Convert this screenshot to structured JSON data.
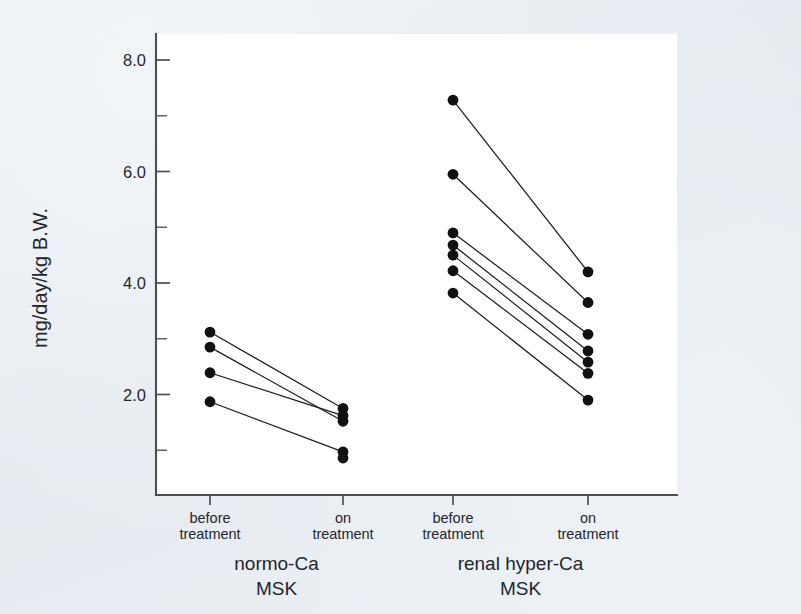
{
  "chart_data": {
    "type": "scatter",
    "subtype": "paired-before-after-dot-plot",
    "title": "",
    "xlabel": "",
    "ylabel": "mg/day/kg B.W.",
    "ylim": [
      0.0,
      8.6
    ],
    "yticks": [
      2.0,
      4.0,
      6.0,
      8.0
    ],
    "ytick_labels": [
      "2.0",
      "4.0",
      "6.0",
      "8.0"
    ],
    "yticks_minor": [
      1.0,
      3.0,
      5.0,
      7.0
    ],
    "grid": false,
    "legend": "none",
    "x_categories": [
      "before treatment",
      "on treatment",
      "before treatment",
      "on treatment"
    ],
    "x_tick_labels": [
      {
        "line1": "before",
        "line2": "treatment"
      },
      {
        "line1": "on",
        "line2": "treatment"
      },
      {
        "line1": "before",
        "line2": "treatment"
      },
      {
        "line1": "on",
        "line2": "treatment"
      }
    ],
    "groups": [
      {
        "name": "normo-Ca MSK",
        "label_line1": "normo-Ca",
        "label_line2": "MSK",
        "n_subjects": 4,
        "series": [
          {
            "name": "before treatment",
            "values": [
              3.12,
              2.85,
              2.39,
              1.87
            ]
          },
          {
            "name": "on treatment",
            "values": [
              1.75,
              1.52,
              1.62,
              0.97
            ]
          }
        ],
        "pairs": [
          {
            "before": 3.12,
            "on": 1.75
          },
          {
            "before": 2.85,
            "on": 1.52
          },
          {
            "before": 2.39,
            "on": 1.62
          },
          {
            "before": 1.87,
            "on": 0.97
          }
        ],
        "on_treatment_extra_points": [
          0.86
        ]
      },
      {
        "name": "renal hyper-Ca MSK",
        "label_line1": "renal hyper-Ca",
        "label_line2": "MSK",
        "n_subjects": 6,
        "series": [
          {
            "name": "before treatment",
            "values": [
              7.28,
              5.95,
              4.9,
              4.68,
              4.5,
              4.22,
              3.82
            ]
          },
          {
            "name": "on treatment",
            "values": [
              4.2,
              3.65,
              3.08,
              2.78,
              2.58,
              2.38,
              1.9
            ]
          }
        ],
        "pairs": [
          {
            "before": 7.28,
            "on": 4.2
          },
          {
            "before": 5.95,
            "on": 3.65
          },
          {
            "before": 4.9,
            "on": 3.08
          },
          {
            "before": 4.68,
            "on": 2.78
          },
          {
            "before": 4.5,
            "on": 2.58
          },
          {
            "before": 4.22,
            "on": 2.38
          },
          {
            "before": 3.82,
            "on": 1.9
          }
        ]
      }
    ]
  },
  "axes": {
    "y_axis_title": "mg/day/kg B.W."
  }
}
